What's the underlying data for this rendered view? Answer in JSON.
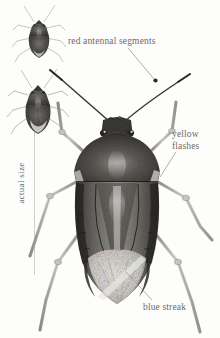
{
  "plate": {
    "subject": "shield bug",
    "style": "grayscale stippled field-guide illustration",
    "background_color": "#fdfdfc",
    "ink_color": "#6b6a68"
  },
  "labels": {
    "antennal_segments": "red antennal segments",
    "yellow_flashes_line1": "yellow",
    "yellow_flashes_line2": "flashes",
    "blue_streak": "blue streak",
    "actual_size": "actual size"
  },
  "specimens": [
    {
      "name": "small-specimen-upper",
      "note": "dorsal view, wings folded"
    },
    {
      "name": "small-specimen-lower",
      "note": "dorsal view, pale membrane visible"
    }
  ],
  "leaders": [
    {
      "name": "leader-antennal-segments",
      "from_label": "red antennal segments",
      "points_to": "right antenna segment node"
    },
    {
      "name": "leader-yellow-flashes",
      "from_label": "yellow flashes",
      "points_to": "lateral pronotum margin"
    },
    {
      "name": "leader-blue-streak",
      "from_label": "blue streak",
      "points_to": "wing membrane"
    }
  ],
  "colors": {
    "body_dark": "#3c3a38",
    "body_mid": "#6e6b67",
    "body_light": "#c9c6c1",
    "membrane": "#e8e6e1",
    "leg": "#b9b6b1",
    "rule": "#cfcecc"
  }
}
